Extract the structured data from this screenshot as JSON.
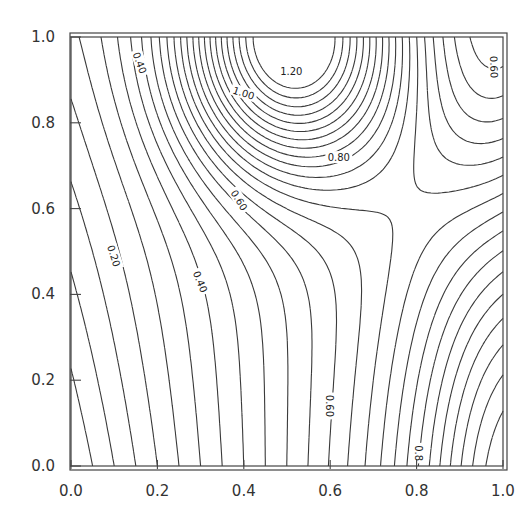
{
  "chart_data": {
    "type": "contour",
    "title": "",
    "xlabel": "",
    "ylabel": "",
    "xlim": [
      0.0,
      1.0
    ],
    "ylim": [
      0.0,
      1.0
    ],
    "x_ticks": [
      "0.0",
      "0.2",
      "0.4",
      "0.6",
      "0.8",
      "1.0"
    ],
    "y_ticks": [
      "0.0",
      "0.2",
      "0.4",
      "0.6",
      "0.8",
      "1.0"
    ],
    "contour_interval": 0.05,
    "contour_levels_min": 0.05,
    "contour_levels_max": 1.3,
    "grid": false,
    "legend": null,
    "features": {
      "maximum": {
        "x": 0.5,
        "y": 1.0,
        "value": 1.3
      },
      "saddle": {
        "x": 0.85,
        "y": 0.55,
        "value": 0.82
      },
      "secondary_high": {
        "x": 1.0,
        "y": 0.0,
        "value": 0.95
      },
      "minimum": {
        "x": 0.0,
        "y": 0.0,
        "value": 0.0
      }
    },
    "contour_labels": [
      {
        "text": "0.40",
        "x": 0.16,
        "y": 0.94,
        "angle": 70
      },
      {
        "text": "1.20",
        "x": 0.51,
        "y": 0.92,
        "angle": 0
      },
      {
        "text": "1.00",
        "x": 0.4,
        "y": 0.87,
        "angle": 18
      },
      {
        "text": "0.80",
        "x": 0.62,
        "y": 0.72,
        "angle": 0
      },
      {
        "text": "0.60",
        "x": 0.98,
        "y": 0.93,
        "angle": 88
      },
      {
        "text": "0.60",
        "x": 0.39,
        "y": 0.62,
        "angle": 58
      },
      {
        "text": "0.20",
        "x": 0.1,
        "y": 0.49,
        "angle": 72
      },
      {
        "text": "0.40",
        "x": 0.3,
        "y": 0.43,
        "angle": 68
      },
      {
        "text": "0.60",
        "x": 0.6,
        "y": 0.14,
        "angle": 90
      },
      {
        "text": "0.8",
        "x": 0.805,
        "y": 0.03,
        "angle": 90
      }
    ]
  }
}
